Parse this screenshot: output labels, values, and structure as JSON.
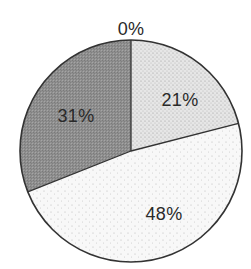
{
  "chart_data": {
    "type": "pie",
    "title": "",
    "start_angle_deg": 0,
    "direction": "clockwise",
    "slices": [
      {
        "label": "0%",
        "value": 0,
        "fill": "#ffffff",
        "texture": "none"
      },
      {
        "label": "21%",
        "value": 21,
        "fill": "#e2e2e2",
        "texture": "dense-dots"
      },
      {
        "label": "48%",
        "value": 48,
        "fill": "#f7f7f7",
        "texture": "sparse-dots"
      },
      {
        "label": "31%",
        "value": 31,
        "fill": "#8e8e8e",
        "texture": "crosshatch"
      }
    ],
    "legend": "none",
    "outline_color": "#333333"
  },
  "labels": {
    "zero": "0%",
    "s21": "21%",
    "s48": "48%",
    "s31": "31%"
  },
  "geometry": {
    "cx": 131,
    "cy": 151,
    "r": 111
  }
}
